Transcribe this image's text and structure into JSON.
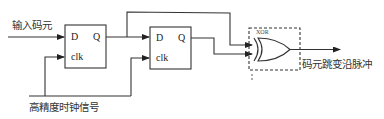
{
  "diagram": {
    "type": "circuit",
    "inputs": {
      "data_in_label": "输入码元",
      "clock_label": "高精度时钟信号"
    },
    "flip_flops": [
      {
        "id": "ff1",
        "d_label": "D",
        "q_label": "Q",
        "clk_label": "clk"
      },
      {
        "id": "ff2",
        "d_label": "D",
        "q_label": "Q",
        "clk_label": "clk"
      }
    ],
    "gate": {
      "type_label": "XOR",
      "index_label": "1"
    },
    "output": {
      "label": "码元跳变沿脉冲"
    },
    "colors": {
      "line": "#333333",
      "background": "#ffffff"
    }
  }
}
